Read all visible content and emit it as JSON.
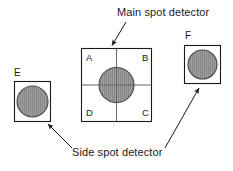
{
  "diagram": {
    "background_color": "#ffffff",
    "line_color": "#1a1a1a",
    "spot_fill_color": "#9a9a9a",
    "spot_stroke_color": "#444444",
    "captions": {
      "main": "Main spot detector",
      "side": "Side spot detector"
    },
    "main_detector": {
      "name": "main-spot-detector",
      "shape": "square-quadrant",
      "quadrants": [
        {
          "id": "A",
          "label": "A",
          "position": "top-left"
        },
        {
          "id": "B",
          "label": "B",
          "position": "top-right"
        },
        {
          "id": "C",
          "label": "C",
          "position": "bottom-right"
        },
        {
          "id": "D",
          "label": "D",
          "position": "bottom-left"
        }
      ],
      "spot": {
        "shape": "circle",
        "hatch": "vertical-lines",
        "centered": true
      }
    },
    "side_detectors": [
      {
        "id": "E",
        "label": "E",
        "name": "side-spot-detector-e",
        "position": "left",
        "spot": {
          "shape": "circle",
          "hatch": "vertical-lines"
        }
      },
      {
        "id": "F",
        "label": "F",
        "name": "side-spot-detector-f",
        "position": "right",
        "spot": {
          "shape": "circle",
          "hatch": "vertical-lines"
        }
      }
    ],
    "arrows": [
      {
        "name": "arrow-main-spot-detector",
        "from": "Main spot detector",
        "to": "main-spot-detector"
      },
      {
        "name": "arrow-side-spot-detector-e",
        "from": "Side spot detector",
        "to": "side-spot-detector-e"
      },
      {
        "name": "arrow-side-spot-detector-f",
        "from": "Side spot detector",
        "to": "side-spot-detector-f"
      }
    ]
  }
}
